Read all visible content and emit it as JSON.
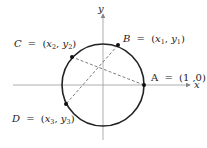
{
  "diagram": {
    "type": "unit-circle",
    "axes": {
      "x_label": "x",
      "y_label": "y"
    },
    "points": [
      {
        "id": "A",
        "label": "A",
        "coords": "(1 ,0)",
        "eq": "="
      },
      {
        "id": "B",
        "label": "B",
        "x": "x",
        "x_sub": "1",
        "y": "y",
        "y_sub": "1",
        "eq": "="
      },
      {
        "id": "C",
        "label": "C",
        "x": "x",
        "x_sub": "2",
        "y": "y",
        "y_sub": "2",
        "eq": "="
      },
      {
        "id": "D",
        "label": "D",
        "x": "x",
        "x_sub": "3",
        "y": "y",
        "y_sub": "3",
        "eq": "="
      }
    ],
    "chords": [
      [
        "A",
        "C"
      ],
      [
        "B",
        "D"
      ]
    ],
    "colors": {
      "line": "#222222",
      "axis": "#888888"
    }
  }
}
